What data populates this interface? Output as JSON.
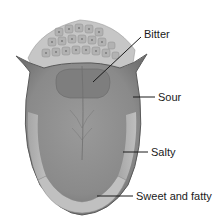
{
  "diagram": {
    "labels": {
      "bitter": "Bitter",
      "sour": "Sour",
      "salty": "Salty",
      "sweet_fatty": "Sweet and fatty"
    },
    "colors": {
      "tongue_body": "#8c8c8c",
      "tongue_outline": "#5a5a5a",
      "sides_light": "#b8b8b8",
      "papillae": "#a8a8a8",
      "leader_line": "#1a1a1a",
      "text": "#1a1a1a"
    }
  }
}
